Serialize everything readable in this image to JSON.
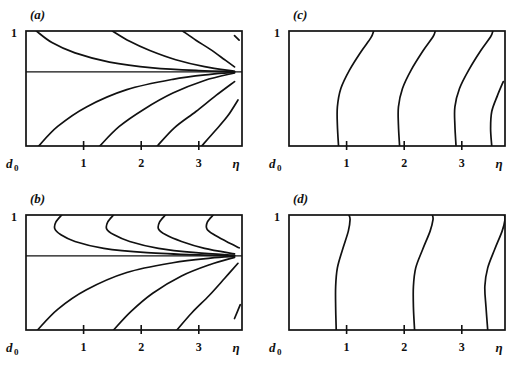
{
  "figure": {
    "background": "#ffffff",
    "ink": "#111111",
    "panel_count": 4
  },
  "chart_data": {
    "type": "line",
    "title": "",
    "xlabel": "η",
    "ylabel": "d₀",
    "xlim": [
      0,
      3.75
    ],
    "ylim": [
      0,
      1
    ],
    "grid": false,
    "legend": "none",
    "panels": [
      {
        "label": "(a)",
        "x_axis_label": "η",
        "x_axis_origin_label": "d",
        "x_axis_origin_sub": "0",
        "y_top_label": "1",
        "xticks": [
          1,
          2,
          3
        ],
        "xtick_labels": [
          "1",
          "2",
          "3"
        ],
        "has_midline": true,
        "midline_y": 0.645,
        "description": "Monotone contours fanning from a focal point on the right edge; upper family descends from the top edge, lower family rises from the bottom edge.",
        "series": [
          {
            "name": "upper-1",
            "points": [
              [
                0.18,
                1.0
              ],
              [
                0.45,
                0.9
              ],
              [
                0.85,
                0.81
              ],
              [
                1.45,
                0.73
              ],
              [
                2.2,
                0.68
              ],
              [
                3.0,
                0.656
              ],
              [
                3.62,
                0.648
              ]
            ]
          },
          {
            "name": "upper-2",
            "points": [
              [
                1.5,
                1.0
              ],
              [
                1.8,
                0.91
              ],
              [
                2.15,
                0.83
              ],
              [
                2.6,
                0.75
              ],
              [
                3.1,
                0.69
              ],
              [
                3.62,
                0.65
              ]
            ]
          },
          {
            "name": "upper-3",
            "points": [
              [
                2.72,
                1.0
              ],
              [
                2.95,
                0.92
              ],
              [
                3.2,
                0.84
              ],
              [
                3.45,
                0.75
              ],
              [
                3.62,
                0.688
              ]
            ]
          },
          {
            "name": "upper-4",
            "points": [
              [
                3.62,
                0.96
              ],
              [
                3.7,
                0.92
              ]
            ]
          },
          {
            "name": "lower-1",
            "points": [
              [
                0.22,
                0.0
              ],
              [
                0.55,
                0.17
              ],
              [
                1.05,
                0.34
              ],
              [
                1.75,
                0.49
              ],
              [
                2.55,
                0.58
              ],
              [
                3.2,
                0.623
              ],
              [
                3.62,
                0.64
              ]
            ]
          },
          {
            "name": "lower-2",
            "points": [
              [
                1.28,
                0.0
              ],
              [
                1.62,
                0.17
              ],
              [
                2.05,
                0.32
              ],
              [
                2.55,
                0.46
              ],
              [
                3.1,
                0.57
              ],
              [
                3.62,
                0.635
              ]
            ]
          },
          {
            "name": "lower-3",
            "points": [
              [
                2.28,
                0.0
              ],
              [
                2.58,
                0.16
              ],
              [
                2.95,
                0.3
              ],
              [
                3.3,
                0.44
              ],
              [
                3.62,
                0.56
              ]
            ]
          },
          {
            "name": "lower-4",
            "points": [
              [
                3.05,
                0.0
              ],
              [
                3.28,
                0.13
              ],
              [
                3.5,
                0.26
              ],
              [
                3.68,
                0.4
              ]
            ]
          }
        ]
      },
      {
        "label": "(b)",
        "x_axis_label": "η",
        "x_axis_origin_label": "d",
        "x_axis_origin_sub": "0",
        "y_top_label": "1",
        "xticks": [
          1,
          2,
          3
        ],
        "xtick_labels": [
          "1",
          "2",
          "3"
        ],
        "has_midline": true,
        "midline_y": 0.645,
        "description": "Upper family shows hooked contours that turn back on themselves near the top edge before sweeping to the right focal point; lower family is a monotone fan.",
        "series": [
          {
            "name": "upper-hook-1",
            "points": [
              [
                0.62,
                1.0
              ],
              [
                0.52,
                0.94
              ],
              [
                0.5,
                0.88
              ],
              [
                0.6,
                0.83
              ],
              [
                0.85,
                0.77
              ],
              [
                1.35,
                0.71
              ],
              [
                2.1,
                0.673
              ],
              [
                3.0,
                0.653
              ],
              [
                3.62,
                0.647
              ]
            ]
          },
          {
            "name": "upper-hook-2",
            "points": [
              [
                1.52,
                1.0
              ],
              [
                1.42,
                0.94
              ],
              [
                1.4,
                0.88
              ],
              [
                1.52,
                0.83
              ],
              [
                1.8,
                0.77
              ],
              [
                2.3,
                0.71
              ],
              [
                2.95,
                0.672
              ],
              [
                3.62,
                0.65
              ]
            ]
          },
          {
            "name": "upper-hook-3",
            "points": [
              [
                2.42,
                1.0
              ],
              [
                2.32,
                0.94
              ],
              [
                2.3,
                0.88
              ],
              [
                2.42,
                0.83
              ],
              [
                2.7,
                0.77
              ],
              [
                3.1,
                0.71
              ],
              [
                3.62,
                0.662
              ]
            ]
          },
          {
            "name": "upper-hook-4",
            "points": [
              [
                3.25,
                1.0
              ],
              [
                3.15,
                0.94
              ],
              [
                3.14,
                0.88
              ],
              [
                3.26,
                0.83
              ],
              [
                3.48,
                0.77
              ],
              [
                3.7,
                0.715
              ]
            ]
          },
          {
            "name": "lower-1",
            "points": [
              [
                0.2,
                0.0
              ],
              [
                0.55,
                0.18
              ],
              [
                1.05,
                0.35
              ],
              [
                1.75,
                0.5
              ],
              [
                2.55,
                0.585
              ],
              [
                3.2,
                0.625
              ],
              [
                3.62,
                0.64
              ]
            ]
          },
          {
            "name": "lower-2",
            "points": [
              [
                1.52,
                0.0
              ],
              [
                1.82,
                0.16
              ],
              [
                2.2,
                0.32
              ],
              [
                2.7,
                0.47
              ],
              [
                3.2,
                0.57
              ],
              [
                3.62,
                0.632
              ]
            ]
          },
          {
            "name": "lower-3",
            "points": [
              [
                2.62,
                0.0
              ],
              [
                2.88,
                0.15
              ],
              [
                3.18,
                0.3
              ],
              [
                3.45,
                0.45
              ],
              [
                3.68,
                0.58
              ]
            ]
          },
          {
            "name": "lower-4",
            "points": [
              [
                3.62,
                0.1
              ],
              [
                3.72,
                0.22
              ]
            ]
          }
        ]
      },
      {
        "label": "(c)",
        "x_axis_label": "η",
        "x_axis_origin_label": "d",
        "x_axis_origin_sub": "0",
        "y_top_label": "1",
        "xticks": [
          1,
          2,
          3
        ],
        "xtick_labels": [
          "1",
          "2",
          "3"
        ],
        "has_midline": false,
        "description": "Four near-vertical S-shaped contours spanning the full height, each leaning right toward the top edge.",
        "series": [
          {
            "name": "curve-1",
            "points": [
              [
                0.86,
                0.0
              ],
              [
                0.84,
                0.18
              ],
              [
                0.84,
                0.34
              ],
              [
                0.9,
                0.5
              ],
              [
                1.05,
                0.66
              ],
              [
                1.25,
                0.82
              ],
              [
                1.42,
                0.94
              ],
              [
                1.47,
                1.0
              ]
            ]
          },
          {
            "name": "curve-2",
            "points": [
              [
                1.92,
                0.0
              ],
              [
                1.9,
                0.18
              ],
              [
                1.9,
                0.34
              ],
              [
                1.97,
                0.5
              ],
              [
                2.12,
                0.66
              ],
              [
                2.33,
                0.83
              ],
              [
                2.5,
                0.95
              ],
              [
                2.54,
                1.0
              ]
            ]
          },
          {
            "name": "curve-3",
            "points": [
              [
                2.9,
                0.0
              ],
              [
                2.88,
                0.18
              ],
              [
                2.88,
                0.34
              ],
              [
                2.96,
                0.5
              ],
              [
                3.12,
                0.66
              ],
              [
                3.33,
                0.83
              ],
              [
                3.5,
                0.95
              ],
              [
                3.54,
                1.0
              ]
            ]
          },
          {
            "name": "curve-4",
            "points": [
              [
                3.52,
                0.0
              ],
              [
                3.5,
                0.15
              ],
              [
                3.52,
                0.3
              ],
              [
                3.62,
                0.44
              ],
              [
                3.72,
                0.56
              ]
            ]
          }
        ]
      },
      {
        "label": "(d)",
        "x_axis_label": "η",
        "x_axis_origin_label": "d",
        "x_axis_origin_sub": "0",
        "y_top_label": "1",
        "xticks": [
          1,
          2,
          3
        ],
        "xtick_labels": [
          "1",
          "2",
          "3"
        ],
        "has_midline": false,
        "description": "Three near-vertical contours spanning the full height, straighter in the lower half and bending left toward the top edge.",
        "series": [
          {
            "name": "curve-1",
            "points": [
              [
                0.82,
                0.0
              ],
              [
                0.81,
                0.2
              ],
              [
                0.81,
                0.38
              ],
              [
                0.84,
                0.54
              ],
              [
                0.93,
                0.7
              ],
              [
                1.03,
                0.86
              ],
              [
                1.06,
                0.96
              ],
              [
                1.04,
                1.0
              ]
            ]
          },
          {
            "name": "curve-2",
            "points": [
              [
                2.18,
                0.0
              ],
              [
                2.16,
                0.2
              ],
              [
                2.16,
                0.38
              ],
              [
                2.2,
                0.54
              ],
              [
                2.32,
                0.7
              ],
              [
                2.45,
                0.86
              ],
              [
                2.5,
                0.96
              ],
              [
                2.49,
                1.0
              ]
            ]
          },
          {
            "name": "curve-3",
            "points": [
              [
                3.45,
                0.0
              ],
              [
                3.42,
                0.2
              ],
              [
                3.4,
                0.38
              ],
              [
                3.45,
                0.54
              ],
              [
                3.57,
                0.7
              ],
              [
                3.7,
                0.86
              ],
              [
                3.75,
                0.96
              ],
              [
                3.74,
                1.0
              ]
            ]
          }
        ]
      }
    ]
  }
}
